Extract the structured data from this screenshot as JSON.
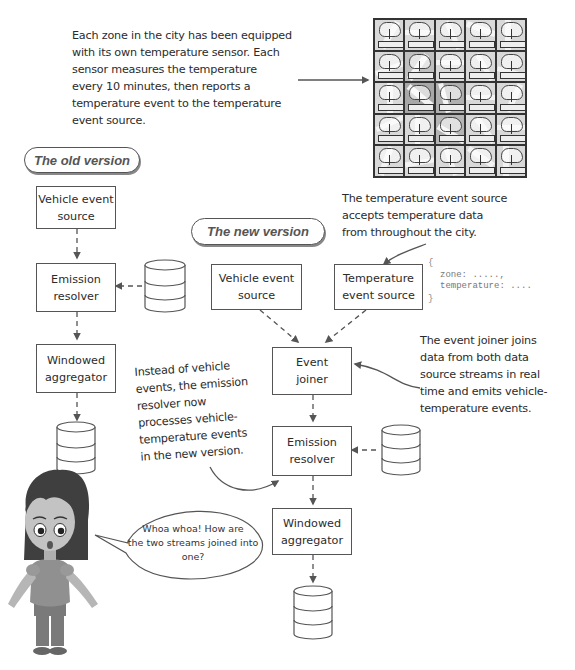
{
  "intro": {
    "lines": [
      "Each zone in the city has been equipped",
      "with its own temperature sensor. Each",
      "sensor measures the temperature",
      "every 10 minutes, then reports a",
      "temperature event to the temperature",
      "event source."
    ]
  },
  "sensor_grid": {
    "rows": 5,
    "cols": 5,
    "icon": "cloud-upload-sensor-icon"
  },
  "old_version": {
    "label": "The old version",
    "boxes": {
      "vehicle_source": [
        "Vehicle event",
        "source"
      ],
      "emission_resolver": [
        "Emission",
        "resolver"
      ],
      "windowed_aggregator": [
        "Windowed",
        "aggregator"
      ]
    }
  },
  "new_version": {
    "label": "The new version",
    "boxes": {
      "vehicle_source": [
        "Vehicle event",
        "source"
      ],
      "temperature_source": [
        "Temperature",
        "event source"
      ],
      "event_joiner": [
        "Event",
        "joiner"
      ],
      "emission_resolver": [
        "Emission",
        "resolver"
      ],
      "windowed_aggregator": [
        "Windowed",
        "aggregator"
      ]
    }
  },
  "temperature_note": {
    "lines": [
      "The temperature event source",
      "accepts temperature data",
      "from throughout the city."
    ]
  },
  "temperature_payload": {
    "open": "{",
    "lines": [
      "zone: .....,",
      "temperature: ...."
    ],
    "close": "}"
  },
  "joiner_note": {
    "lines": [
      "The event joiner joins",
      "data from both data",
      "source streams in real",
      "time and emits vehicle-",
      "temperature events."
    ]
  },
  "resolver_note": {
    "lines": [
      "Instead of vehicle",
      "events, the emission",
      "resolver now",
      "processes vehicle-",
      "temperature events",
      "in the new version."
    ]
  },
  "speech_bubble": {
    "lines": [
      "Whoa whoa!  How are",
      "the two streams joined into",
      "one?"
    ]
  },
  "colors": {
    "line": "#555555",
    "text": "#2b2b2b",
    "background": "#ffffff"
  }
}
